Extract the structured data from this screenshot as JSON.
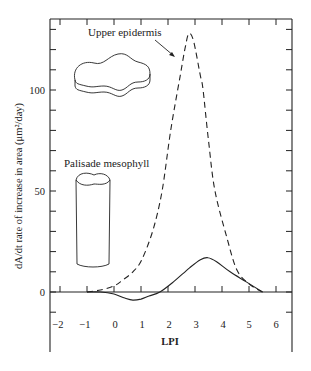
{
  "chart_data": {
    "type": "line",
    "title": "",
    "xlabel": "LPI",
    "ylabel": "dA/dt rate of increase in area (μm²/day)",
    "xlim": [
      -2.4,
      6.6
    ],
    "ylim": [
      -15,
      135
    ],
    "x_ticks": [
      -2,
      -1,
      0,
      1,
      2,
      3,
      4,
      5,
      6
    ],
    "y_tick_labels": [
      0,
      50,
      100
    ],
    "y_minor_step": 10,
    "grid": false,
    "legend": null,
    "series": [
      {
        "name": "Upper epidermis",
        "style": "dashed",
        "points": [
          [
            -1.0,
            0
          ],
          [
            -0.5,
            1
          ],
          [
            0.0,
            3
          ],
          [
            0.33,
            6
          ],
          [
            0.7,
            10
          ],
          [
            1.03,
            16
          ],
          [
            1.45,
            31
          ],
          [
            1.78,
            50
          ],
          [
            2.1,
            80
          ],
          [
            2.45,
            107
          ],
          [
            2.65,
            122
          ],
          [
            2.78,
            128
          ],
          [
            2.95,
            124
          ],
          [
            3.2,
            107
          ],
          [
            3.3,
            100
          ],
          [
            3.5,
            75
          ],
          [
            3.74,
            50
          ],
          [
            4.2,
            26
          ],
          [
            4.55,
            11
          ],
          [
            5.0,
            4
          ],
          [
            5.5,
            0
          ]
        ]
      },
      {
        "name": "Palisade mesophyll",
        "style": "solid",
        "points": [
          [
            -1.0,
            0
          ],
          [
            -0.5,
            0
          ],
          [
            0.0,
            -1
          ],
          [
            0.4,
            -3
          ],
          [
            0.7,
            -4
          ],
          [
            1.0,
            -3.5
          ],
          [
            1.3,
            -2
          ],
          [
            1.7,
            0
          ],
          [
            2.2,
            5
          ],
          [
            2.8,
            12
          ],
          [
            3.2,
            16
          ],
          [
            3.48,
            17
          ],
          [
            3.8,
            15
          ],
          [
            4.3,
            10
          ],
          [
            4.9,
            5
          ],
          [
            5.5,
            0
          ]
        ]
      }
    ],
    "annotations": [
      {
        "text": "Upper epidermis",
        "target_series": "Upper epidermis",
        "arrow": true,
        "illustration": "flat wavy epidermal cell"
      },
      {
        "text": "Palisade mesophyll",
        "target_series": "Palisade mesophyll",
        "arrow": false,
        "illustration": "cylindrical palisade cell"
      }
    ]
  },
  "labels": {
    "xlabel": "LPI",
    "ylabel": "dA/dt rate of increase in area (μm²/day)",
    "upper": "Upper epidermis",
    "palisade": "Palisade mesophyll",
    "y0": "0",
    "y50": "50",
    "y100": "100",
    "xm2": "−2",
    "xm1": "−1",
    "x0": "0",
    "x1": "1",
    "x2": "2",
    "x3": "3",
    "x4": "4",
    "x5": "5",
    "x6": "6"
  }
}
